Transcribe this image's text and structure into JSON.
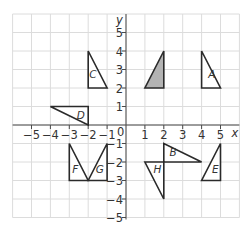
{
  "axes": {
    "x_label": "x",
    "y_label": "y",
    "origin_label": "0",
    "x_range": [
      -6,
      6
    ],
    "y_range": [
      -5,
      6
    ],
    "x_ticks": [
      -5,
      -4,
      -3,
      -2,
      -1,
      1,
      2,
      3,
      4,
      5
    ],
    "y_ticks": [
      -5,
      -4,
      -3,
      -2,
      -1,
      1,
      2,
      3,
      4,
      5
    ],
    "x_tick_labels": [
      "−5",
      "−4",
      "−3",
      "−2",
      "−1",
      "1",
      "2",
      "3",
      "4",
      "5"
    ],
    "y_tick_labels": [
      "−5",
      "−4",
      "−3",
      "−2",
      "−1",
      "1",
      "2",
      "3",
      "4",
      "5"
    ]
  },
  "colors": {
    "grid": "#dcdcdc",
    "axis": "#4a4a4a",
    "outline": "#2a2a2a",
    "shaded_fill": "#b3b3b3"
  },
  "shapes": [
    {
      "label": "",
      "shaded": true,
      "vertices": [
        [
          1,
          2
        ],
        [
          2,
          2
        ],
        [
          2,
          4
        ]
      ],
      "label_pos": null
    },
    {
      "label": "A",
      "shaded": false,
      "vertices": [
        [
          4,
          4
        ],
        [
          4,
          2
        ],
        [
          5,
          2
        ]
      ],
      "label_pos": [
        4.35,
        2.55
      ]
    },
    {
      "label": "B",
      "shaded": false,
      "vertices": [
        [
          2,
          -1
        ],
        [
          2,
          -2
        ],
        [
          4,
          -2
        ]
      ],
      "label_pos": [
        2.3,
        -1.65
      ]
    },
    {
      "label": "C",
      "shaded": false,
      "vertices": [
        [
          -2,
          4
        ],
        [
          -2,
          2
        ],
        [
          -1,
          2
        ]
      ],
      "label_pos": [
        -1.95,
        2.55
      ]
    },
    {
      "label": "D",
      "shaded": false,
      "vertices": [
        [
          -4,
          1
        ],
        [
          -2,
          1
        ],
        [
          -2,
          0
        ]
      ],
      "label_pos": [
        -2.6,
        0.3
      ]
    },
    {
      "label": "E",
      "shaded": false,
      "vertices": [
        [
          5,
          -1
        ],
        [
          5,
          -3
        ],
        [
          4,
          -3
        ]
      ],
      "label_pos": [
        4.55,
        -2.6
      ]
    },
    {
      "label": "F",
      "shaded": false,
      "vertices": [
        [
          -3,
          -1
        ],
        [
          -3,
          -3
        ],
        [
          -2,
          -3
        ]
      ],
      "label_pos": [
        -2.85,
        -2.6
      ]
    },
    {
      "label": "G",
      "shaded": false,
      "vertices": [
        [
          -2,
          -3
        ],
        [
          -1,
          -3
        ],
        [
          -1,
          -1
        ]
      ],
      "label_pos": [
        -1.6,
        -2.6
      ]
    },
    {
      "label": "H",
      "shaded": false,
      "vertices": [
        [
          1,
          -2
        ],
        [
          2,
          -2
        ],
        [
          2,
          -4
        ]
      ],
      "label_pos": [
        1.45,
        -2.6
      ]
    }
  ]
}
